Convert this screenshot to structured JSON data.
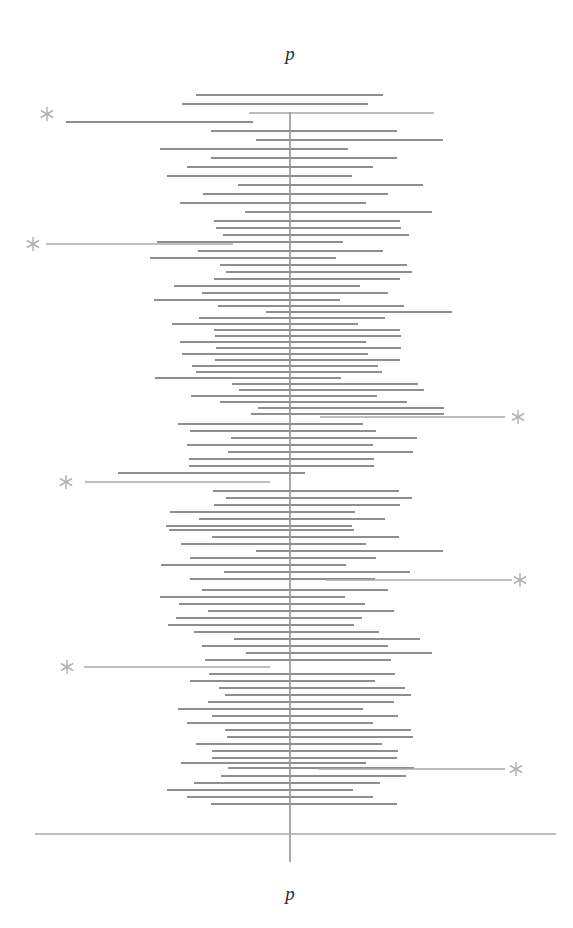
{
  "figure": {
    "type": "forest-plot",
    "top_axis_label": "p",
    "bottom_axis_label": "p",
    "line_color": "#8e8e8e",
    "axis_color": "#a9a9a9",
    "marker_color": "#b2b2b2",
    "background_color": "#ffffff"
  },
  "chart_data": {
    "type": "line",
    "title": "",
    "subtitle": "",
    "xlabel": "p",
    "ylabel": "",
    "legend": [],
    "grid": false,
    "axis": {
      "center_x_px": 290,
      "center_value": 0,
      "x_pixel_range": [
        35,
        556
      ],
      "baseline_y_px": 834,
      "vertical_line_y_range": [
        112,
        862
      ]
    },
    "marker_symbol": "*",
    "marker_meaning": "significant interval",
    "n_intervals": 100,
    "categories": [],
    "intervals": [
      {
        "y": 95,
        "x1": 196,
        "x2": 383,
        "marker": null
      },
      {
        "y": 104,
        "x1": 182,
        "x2": 368,
        "marker": null
      },
      {
        "y": 113,
        "x1": 249,
        "x2": 434,
        "marker": "left"
      },
      {
        "y": 122,
        "x1": 66,
        "x2": 253,
        "marker": null
      },
      {
        "y": 131,
        "x1": 211,
        "x2": 397,
        "marker": null
      },
      {
        "y": 140,
        "x1": 256,
        "x2": 443,
        "marker": null
      },
      {
        "y": 149,
        "x1": 160,
        "x2": 348,
        "marker": null
      },
      {
        "y": 158,
        "x1": 211,
        "x2": 397,
        "marker": null
      },
      {
        "y": 167,
        "x1": 187,
        "x2": 373,
        "marker": null
      },
      {
        "y": 176,
        "x1": 167,
        "x2": 352,
        "marker": null
      },
      {
        "y": 185,
        "x1": 238,
        "x2": 423,
        "marker": null
      },
      {
        "y": 194,
        "x1": 203,
        "x2": 388,
        "marker": null
      },
      {
        "y": 203,
        "x1": 180,
        "x2": 366,
        "marker": null
      },
      {
        "y": 212,
        "x1": 245,
        "x2": 432,
        "marker": null
      },
      {
        "y": 221,
        "x1": 214,
        "x2": 400,
        "marker": null
      },
      {
        "y": 228,
        "x1": 216,
        "x2": 401,
        "marker": null
      },
      {
        "y": 235,
        "x1": 223,
        "x2": 409,
        "marker": null
      },
      {
        "y": 242,
        "x1": 157,
        "x2": 343,
        "marker": null
      },
      {
        "y": 244,
        "x1": 46,
        "x2": 233,
        "marker": "left"
      },
      {
        "y": 251,
        "x1": 198,
        "x2": 383,
        "marker": null
      },
      {
        "y": 258,
        "x1": 150,
        "x2": 336,
        "marker": null
      },
      {
        "y": 265,
        "x1": 220,
        "x2": 407,
        "marker": null
      },
      {
        "y": 272,
        "x1": 226,
        "x2": 412,
        "marker": null
      },
      {
        "y": 279,
        "x1": 214,
        "x2": 400,
        "marker": null
      },
      {
        "y": 286,
        "x1": 174,
        "x2": 360,
        "marker": null
      },
      {
        "y": 293,
        "x1": 202,
        "x2": 388,
        "marker": null
      },
      {
        "y": 300,
        "x1": 154,
        "x2": 340,
        "marker": null
      },
      {
        "y": 306,
        "x1": 218,
        "x2": 404,
        "marker": null
      },
      {
        "y": 312,
        "x1": 266,
        "x2": 452,
        "marker": null
      },
      {
        "y": 318,
        "x1": 199,
        "x2": 385,
        "marker": null
      },
      {
        "y": 324,
        "x1": 172,
        "x2": 358,
        "marker": null
      },
      {
        "y": 330,
        "x1": 214,
        "x2": 400,
        "marker": null
      },
      {
        "y": 336,
        "x1": 215,
        "x2": 401,
        "marker": null
      },
      {
        "y": 342,
        "x1": 180,
        "x2": 366,
        "marker": null
      },
      {
        "y": 348,
        "x1": 216,
        "x2": 401,
        "marker": null
      },
      {
        "y": 354,
        "x1": 182,
        "x2": 368,
        "marker": null
      },
      {
        "y": 360,
        "x1": 215,
        "x2": 400,
        "marker": null
      },
      {
        "y": 366,
        "x1": 192,
        "x2": 378,
        "marker": null
      },
      {
        "y": 372,
        "x1": 196,
        "x2": 382,
        "marker": null
      },
      {
        "y": 378,
        "x1": 155,
        "x2": 341,
        "marker": null
      },
      {
        "y": 384,
        "x1": 232,
        "x2": 418,
        "marker": null
      },
      {
        "y": 390,
        "x1": 239,
        "x2": 424,
        "marker": null
      },
      {
        "y": 396,
        "x1": 191,
        "x2": 377,
        "marker": null
      },
      {
        "y": 402,
        "x1": 220,
        "x2": 407,
        "marker": null
      },
      {
        "y": 408,
        "x1": 258,
        "x2": 444,
        "marker": null
      },
      {
        "y": 414,
        "x1": 251,
        "x2": 444,
        "marker": null
      },
      {
        "y": 417,
        "x1": 320,
        "x2": 505,
        "marker": "right"
      },
      {
        "y": 424,
        "x1": 178,
        "x2": 363,
        "marker": null
      },
      {
        "y": 431,
        "x1": 190,
        "x2": 376,
        "marker": null
      },
      {
        "y": 438,
        "x1": 231,
        "x2": 417,
        "marker": null
      },
      {
        "y": 445,
        "x1": 187,
        "x2": 373,
        "marker": null
      },
      {
        "y": 452,
        "x1": 228,
        "x2": 413,
        "marker": null
      },
      {
        "y": 459,
        "x1": 189,
        "x2": 374,
        "marker": null
      },
      {
        "y": 466,
        "x1": 189,
        "x2": 374,
        "marker": null
      },
      {
        "y": 473,
        "x1": 118,
        "x2": 305,
        "marker": null
      },
      {
        "y": 482,
        "x1": 85,
        "x2": 270,
        "marker": "left"
      },
      {
        "y": 491,
        "x1": 213,
        "x2": 399,
        "marker": null
      },
      {
        "y": 498,
        "x1": 226,
        "x2": 412,
        "marker": null
      },
      {
        "y": 505,
        "x1": 214,
        "x2": 400,
        "marker": null
      },
      {
        "y": 512,
        "x1": 170,
        "x2": 355,
        "marker": null
      },
      {
        "y": 519,
        "x1": 199,
        "x2": 385,
        "marker": null
      },
      {
        "y": 526,
        "x1": 166,
        "x2": 352,
        "marker": null
      },
      {
        "y": 530,
        "x1": 169,
        "x2": 354,
        "marker": null
      },
      {
        "y": 537,
        "x1": 212,
        "x2": 399,
        "marker": null
      },
      {
        "y": 544,
        "x1": 181,
        "x2": 366,
        "marker": null
      },
      {
        "y": 551,
        "x1": 256,
        "x2": 443,
        "marker": null
      },
      {
        "y": 558,
        "x1": 190,
        "x2": 376,
        "marker": null
      },
      {
        "y": 565,
        "x1": 161,
        "x2": 346,
        "marker": null
      },
      {
        "y": 572,
        "x1": 224,
        "x2": 410,
        "marker": null
      },
      {
        "y": 579,
        "x1": 190,
        "x2": 375,
        "marker": null
      },
      {
        "y": 580,
        "x1": 326,
        "x2": 512,
        "marker": "right"
      },
      {
        "y": 590,
        "x1": 202,
        "x2": 388,
        "marker": null
      },
      {
        "y": 597,
        "x1": 160,
        "x2": 345,
        "marker": null
      },
      {
        "y": 604,
        "x1": 179,
        "x2": 365,
        "marker": null
      },
      {
        "y": 611,
        "x1": 208,
        "x2": 394,
        "marker": null
      },
      {
        "y": 618,
        "x1": 176,
        "x2": 362,
        "marker": null
      },
      {
        "y": 625,
        "x1": 168,
        "x2": 354,
        "marker": null
      },
      {
        "y": 632,
        "x1": 194,
        "x2": 379,
        "marker": null
      },
      {
        "y": 639,
        "x1": 234,
        "x2": 420,
        "marker": null
      },
      {
        "y": 646,
        "x1": 202,
        "x2": 388,
        "marker": null
      },
      {
        "y": 653,
        "x1": 246,
        "x2": 432,
        "marker": null
      },
      {
        "y": 660,
        "x1": 205,
        "x2": 391,
        "marker": null
      },
      {
        "y": 667,
        "x1": 84,
        "x2": 270,
        "marker": "left"
      },
      {
        "y": 674,
        "x1": 209,
        "x2": 395,
        "marker": null
      },
      {
        "y": 681,
        "x1": 190,
        "x2": 375,
        "marker": null
      },
      {
        "y": 688,
        "x1": 219,
        "x2": 405,
        "marker": null
      },
      {
        "y": 695,
        "x1": 225,
        "x2": 411,
        "marker": null
      },
      {
        "y": 702,
        "x1": 208,
        "x2": 394,
        "marker": null
      },
      {
        "y": 709,
        "x1": 178,
        "x2": 363,
        "marker": null
      },
      {
        "y": 716,
        "x1": 212,
        "x2": 398,
        "marker": null
      },
      {
        "y": 723,
        "x1": 187,
        "x2": 373,
        "marker": null
      },
      {
        "y": 730,
        "x1": 225,
        "x2": 411,
        "marker": null
      },
      {
        "y": 737,
        "x1": 227,
        "x2": 413,
        "marker": null
      },
      {
        "y": 744,
        "x1": 196,
        "x2": 382,
        "marker": null
      },
      {
        "y": 751,
        "x1": 212,
        "x2": 398,
        "marker": null
      },
      {
        "y": 758,
        "x1": 212,
        "x2": 397,
        "marker": null
      },
      {
        "y": 763,
        "x1": 181,
        "x2": 366,
        "marker": null
      },
      {
        "y": 768,
        "x1": 228,
        "x2": 414,
        "marker": null
      },
      {
        "y": 769,
        "x1": 319,
        "x2": 505,
        "marker": "right"
      },
      {
        "y": 776,
        "x1": 221,
        "x2": 406,
        "marker": null
      },
      {
        "y": 783,
        "x1": 194,
        "x2": 380,
        "marker": null
      },
      {
        "y": 790,
        "x1": 167,
        "x2": 353,
        "marker": null
      },
      {
        "y": 797,
        "x1": 187,
        "x2": 373,
        "marker": null
      },
      {
        "y": 804,
        "x1": 211,
        "x2": 397,
        "marker": null
      }
    ],
    "markers": [
      {
        "label": "*",
        "x": 47,
        "y": 114
      },
      {
        "label": "*",
        "x": 33,
        "y": 244
      },
      {
        "label": "*",
        "x": 66,
        "y": 482
      },
      {
        "label": "*",
        "x": 518,
        "y": 417
      },
      {
        "label": "*",
        "x": 520,
        "y": 580
      },
      {
        "label": "*",
        "x": 67,
        "y": 667
      },
      {
        "label": "*",
        "x": 516,
        "y": 769
      }
    ]
  }
}
